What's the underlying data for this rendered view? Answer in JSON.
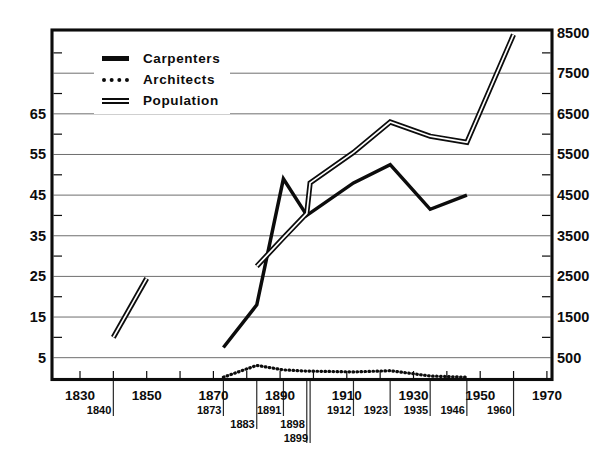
{
  "chart_data": {
    "type": "line",
    "title": "",
    "background": "#ffffff",
    "ink_color": "#0c0c0c",
    "gridline_color": "#6e6e6e",
    "left_axis": {
      "tick_values": [
        5,
        15,
        25,
        35,
        45,
        55,
        65
      ],
      "minor_tick_values": [
        10,
        20,
        30,
        40,
        50,
        60,
        70,
        80
      ],
      "gridline_values": [
        5,
        15,
        25,
        35,
        45,
        55,
        65,
        75
      ],
      "range": [
        0,
        86
      ]
    },
    "right_axis": {
      "tick_values": [
        500,
        1500,
        2500,
        3500,
        4500,
        5500,
        6500,
        7500,
        8500
      ],
      "range": [
        0,
        8600
      ]
    },
    "x_axis": {
      "range": [
        1822,
        1971.5
      ],
      "decade_ticks": [
        1830,
        1840,
        1850,
        1860,
        1870,
        1880,
        1890,
        1900,
        1910,
        1920,
        1930,
        1940,
        1950,
        1960,
        1970
      ],
      "major_labels": [
        "1830",
        "1850",
        "1870",
        "1890",
        "1910",
        "1930",
        "1950",
        "1970"
      ],
      "major_label_years": [
        1830,
        1850,
        1870,
        1890,
        1910,
        1930,
        1950,
        1970
      ],
      "event_years": [
        {
          "label": "1840",
          "year": 1840,
          "row": 1,
          "leader_row": 1
        },
        {
          "label": "1873",
          "year": 1873,
          "row": 1,
          "leader_row": 1
        },
        {
          "label": "1883",
          "year": 1883,
          "row": 2,
          "leader_row": 2
        },
        {
          "label": "1891",
          "year": 1891,
          "row": 1,
          "leader_row": 1
        },
        {
          "label": "1898",
          "year": 1898,
          "row": 2,
          "leader_row": 3
        },
        {
          "label": "1899",
          "year": 1899,
          "row": 3,
          "leader_row": 3
        },
        {
          "label": "1912",
          "year": 1912,
          "row": 1,
          "leader_row": 1
        },
        {
          "label": "1923",
          "year": 1923,
          "row": 1,
          "leader_row": 1
        },
        {
          "label": "1935",
          "year": 1935,
          "row": 1,
          "leader_row": 1
        },
        {
          "label": "1946",
          "year": 1946,
          "row": 1,
          "leader_row": 1
        },
        {
          "label": "1960",
          "year": 1960,
          "row": 1,
          "leader_row": 1
        }
      ]
    },
    "series": [
      {
        "name": "Carpenters",
        "axis": "left",
        "style": "solid",
        "points": [
          [
            1873,
            7.5
          ],
          [
            1883,
            18
          ],
          [
            1891,
            49
          ],
          [
            1898,
            40
          ],
          [
            1912,
            48
          ],
          [
            1923,
            52.5
          ],
          [
            1935,
            41.5
          ],
          [
            1946,
            45
          ]
        ]
      },
      {
        "name": "Architects",
        "axis": "left",
        "style": "dotted",
        "points": [
          [
            1873,
            0.2
          ],
          [
            1883,
            3.1
          ],
          [
            1891,
            2.0
          ],
          [
            1898,
            1.7
          ],
          [
            1899,
            1.7
          ],
          [
            1912,
            1.5
          ],
          [
            1923,
            1.8
          ],
          [
            1935,
            0.5
          ],
          [
            1946,
            0.2
          ]
        ]
      },
      {
        "name": "Population",
        "axis": "right",
        "style": "double-line",
        "segments": [
          [
            [
              1840,
              1000
            ],
            [
              1850,
              2450
            ]
          ],
          [
            [
              1883,
              2750
            ],
            [
              1891,
              3450
            ],
            [
              1898,
              4050
            ],
            [
              1899,
              4800
            ],
            [
              1912,
              5550
            ],
            [
              1923,
              6300
            ],
            [
              1935,
              5950
            ],
            [
              1946,
              5800
            ],
            [
              1960,
              8450
            ]
          ]
        ]
      }
    ],
    "legend": {
      "position": "top-left",
      "entries": [
        "Carpenters",
        "Architects",
        "Population"
      ]
    }
  }
}
